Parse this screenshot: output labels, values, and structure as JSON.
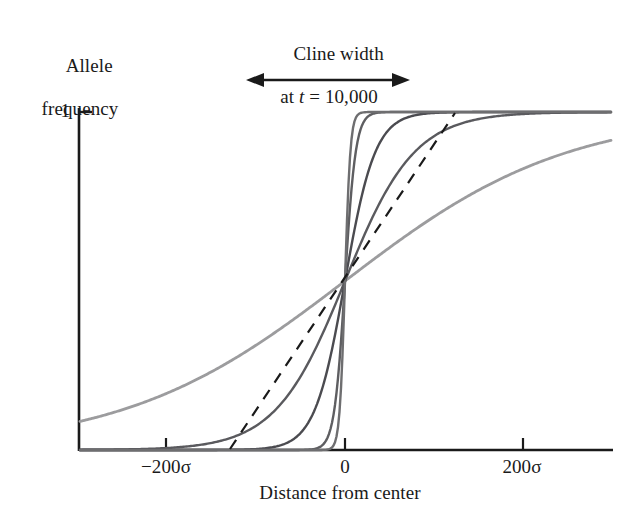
{
  "figure": {
    "background": "#ffffff",
    "ink": "#1a1a1a"
  },
  "annotation": {
    "title_line1": "Cline width",
    "title_italic_var": "t",
    "title_prefix": "at ",
    "title_suffix": " = 10,000",
    "arrow_name": "double-headed-arrow"
  },
  "axes": {
    "y_title_line1": "Allele",
    "y_title_line2": "frequency",
    "y_tick_label": "1",
    "x_title": "Distance from center",
    "x_tick_labels": [
      "−200σ",
      "0",
      "200σ"
    ]
  },
  "chart_data": {
    "type": "line",
    "title": "Cline width at t = 10,000",
    "xlabel": "Distance from center",
    "ylabel": "Allele frequency",
    "xlim": [
      -300,
      300
    ],
    "ylim": [
      0,
      1
    ],
    "xtick_values": [
      -200,
      0,
      200
    ],
    "xtick_labels": [
      "−200σ",
      "0",
      "200σ"
    ],
    "ytick_values": [
      1
    ],
    "ytick_labels": [
      "1"
    ],
    "grid": false,
    "legend": null,
    "x_units": "sigma (dispersal standard deviations)",
    "note": "Family of logistic cline shapes all passing through (0, 0.5); cline width increases from the steepest (near step) curve to the broadest curve. Dashed line is the tangent to the broadest cline at its centre, whose intercepts with frequency 0 and 1 define the cline width marked by the arrow.",
    "annotations": [
      {
        "name": "cline-width-arrow",
        "text": "Cline width at t = 10,000",
        "x_start": -110,
        "x_end": 70,
        "y": 1.12,
        "style": "double-headed arrow"
      },
      {
        "name": "tangent-line",
        "style": "dashed",
        "x_start": -129,
        "x_end": 124,
        "y_start": 0.0,
        "y_end": 1.0
      }
    ],
    "series": [
      {
        "name": "cline-1-steepest",
        "color": "#6e6e70",
        "width_sigma": 6,
        "slope_scale": 3,
        "x": [
          -300,
          -20,
          -12,
          -8,
          -5,
          -3,
          -2,
          -1,
          0,
          1,
          2,
          3,
          5,
          8,
          12,
          20,
          300
        ],
        "y": [
          0.0,
          0.001,
          0.018,
          0.069,
          0.182,
          0.269,
          0.354,
          0.417,
          0.5,
          0.583,
          0.646,
          0.731,
          0.818,
          0.931,
          0.982,
          0.999,
          1.0
        ]
      },
      {
        "name": "cline-2",
        "color": "#5e5e61",
        "width_sigma": 12,
        "slope_scale": 6,
        "x": [
          -300,
          -40,
          -24,
          -16,
          -10,
          -6,
          -4,
          -2,
          0,
          2,
          4,
          6,
          10,
          16,
          24,
          40,
          300
        ],
        "y": [
          0.0,
          0.001,
          0.018,
          0.069,
          0.182,
          0.269,
          0.354,
          0.417,
          0.5,
          0.583,
          0.646,
          0.731,
          0.818,
          0.931,
          0.982,
          0.999,
          1.0
        ]
      },
      {
        "name": "cline-3",
        "color": "#4b4b50",
        "width_sigma": 34,
        "slope_scale": 17,
        "x": [
          -300,
          -110,
          -68,
          -45,
          -28,
          -17,
          -11,
          -6,
          0,
          6,
          11,
          17,
          28,
          45,
          68,
          110,
          300
        ],
        "y": [
          0.0,
          0.001,
          0.018,
          0.069,
          0.182,
          0.269,
          0.354,
          0.417,
          0.5,
          0.583,
          0.646,
          0.731,
          0.818,
          0.931,
          0.982,
          0.999,
          1.0
        ]
      },
      {
        "name": "cline-4",
        "color": "#5a5a5e",
        "width_sigma": 78,
        "slope_scale": 39,
        "x": [
          -300,
          -250,
          -156,
          -104,
          -65,
          -39,
          -25,
          -13,
          0,
          13,
          25,
          39,
          65,
          104,
          156,
          250,
          300
        ],
        "y": [
          0.0,
          0.0016,
          0.018,
          0.069,
          0.182,
          0.269,
          0.354,
          0.417,
          0.5,
          0.583,
          0.646,
          0.731,
          0.818,
          0.931,
          0.982,
          0.9984,
          0.9992
        ]
      },
      {
        "name": "cline-5-broadest",
        "color": "#9c9c9e",
        "width_sigma": 250,
        "slope_scale": 125,
        "x": [
          -300,
          -250,
          -200,
          -150,
          -100,
          -60,
          -30,
          -15,
          0,
          15,
          30,
          60,
          100,
          150,
          200,
          250,
          300
        ],
        "y": [
          0.082,
          0.119,
          0.168,
          0.231,
          0.31,
          0.382,
          0.44,
          0.47,
          0.5,
          0.53,
          0.56,
          0.618,
          0.69,
          0.769,
          0.832,
          0.881,
          0.918
        ]
      }
    ]
  }
}
